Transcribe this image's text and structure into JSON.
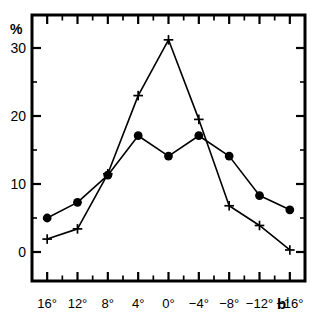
{
  "chart_data": {
    "type": "line",
    "title": "",
    "subtitle": "",
    "xlabel": "b",
    "xlabel_superscript": "I",
    "ylabel": "%",
    "categories": [
      "16°",
      "12°",
      "8°",
      "4°",
      "0°",
      "−4°",
      "−8°",
      "−12°",
      "−16°"
    ],
    "x": [
      16,
      12,
      8,
      4,
      0,
      -4,
      -8,
      -12,
      -16
    ],
    "xlim": [
      18,
      -18
    ],
    "ylim": [
      -3.5,
      33.5
    ],
    "yticks": [
      0,
      10,
      20,
      30
    ],
    "ytick_labels": [
      "0",
      "10",
      "20",
      "30"
    ],
    "grid": false,
    "legend": "none",
    "minor_ticks": true,
    "series": [
      {
        "name": "filled-circles",
        "marker": "circle",
        "color": "#000000",
        "values": [
          5.0,
          7.3,
          11.3,
          17.1,
          14.1,
          17.1,
          14.1,
          8.3,
          6.2
        ]
      },
      {
        "name": "crosses",
        "marker": "plus",
        "color": "#000000",
        "values": [
          1.9,
          3.4,
          11.5,
          23.0,
          31.2,
          19.5,
          6.8,
          3.9,
          0.3
        ]
      }
    ]
  },
  "axes": {
    "y_unit_label": "%",
    "x_title": "b",
    "x_title_sup": "I"
  }
}
